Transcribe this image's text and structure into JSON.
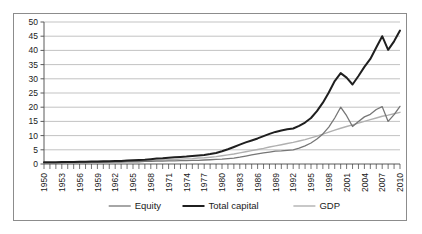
{
  "chart_data": {
    "type": "line",
    "title": "",
    "subtitle": "",
    "xlabel": "",
    "ylabel": "",
    "grid": "horizontal",
    "legend_position": "bottom",
    "ylim": [
      0,
      50
    ],
    "ytick_labels": [
      "0",
      "5",
      "10",
      "15",
      "20",
      "25",
      "30",
      "35",
      "40",
      "45",
      "50"
    ],
    "ytick_values": [
      0,
      5,
      10,
      15,
      20,
      25,
      30,
      35,
      40,
      45,
      50
    ],
    "xlim": [
      1950,
      2010
    ],
    "xtick_labels": [
      "1950",
      "1953",
      "1956",
      "1959",
      "1962",
      "1965",
      "1968",
      "1971",
      "1974",
      "1977",
      "1980",
      "1983",
      "1986",
      "1989",
      "1992",
      "1995",
      "1998",
      "2001",
      "2004",
      "2007",
      "2010"
    ],
    "xtick_values": [
      1950,
      1953,
      1956,
      1959,
      1962,
      1965,
      1968,
      1971,
      1974,
      1977,
      1980,
      1983,
      1986,
      1989,
      1992,
      1995,
      1998,
      2001,
      2004,
      2007,
      2010
    ],
    "x": [
      1950,
      1951,
      1952,
      1953,
      1954,
      1955,
      1956,
      1957,
      1958,
      1959,
      1960,
      1961,
      1962,
      1963,
      1964,
      1965,
      1966,
      1967,
      1968,
      1969,
      1970,
      1971,
      1972,
      1973,
      1974,
      1975,
      1976,
      1977,
      1978,
      1979,
      1980,
      1981,
      1982,
      1983,
      1984,
      1985,
      1986,
      1987,
      1988,
      1989,
      1990,
      1991,
      1992,
      1993,
      1994,
      1995,
      1996,
      1997,
      1998,
      1999,
      2000,
      2001,
      2002,
      2003,
      2004,
      2005,
      2006,
      2007,
      2008,
      2009,
      2010
    ],
    "series": [
      {
        "name": "Equity",
        "color": "#767676",
        "width": 1.3,
        "values": [
          0.4,
          0.4,
          0.4,
          0.4,
          0.5,
          0.5,
          0.5,
          0.5,
          0.6,
          0.6,
          0.6,
          0.7,
          0.7,
          0.7,
          0.8,
          0.8,
          0.8,
          0.9,
          0.9,
          1.0,
          1.0,
          1.1,
          1.1,
          1.2,
          1.2,
          1.3,
          1.3,
          1.4,
          1.5,
          1.6,
          1.7,
          1.9,
          2.1,
          2.4,
          2.8,
          3.2,
          3.6,
          3.9,
          4.2,
          4.5,
          4.6,
          4.8,
          5.0,
          5.6,
          6.4,
          7.4,
          8.8,
          10.6,
          13.0,
          16.2,
          20.0,
          17.0,
          13.2,
          15.0,
          16.6,
          17.5,
          19.2,
          20.2,
          15.0,
          17.4,
          20.3
        ]
      },
      {
        "name": "Total capital",
        "color": "#1f1f1f",
        "width": 2.0,
        "values": [
          0.6,
          0.6,
          0.6,
          0.7,
          0.7,
          0.7,
          0.8,
          0.8,
          0.9,
          0.9,
          1.0,
          1.0,
          1.1,
          1.1,
          1.2,
          1.3,
          1.4,
          1.5,
          1.7,
          1.9,
          2.0,
          2.2,
          2.4,
          2.5,
          2.6,
          2.8,
          3.0,
          3.2,
          3.5,
          3.9,
          4.5,
          5.2,
          6.0,
          6.8,
          7.6,
          8.3,
          9.0,
          9.8,
          10.6,
          11.3,
          11.8,
          12.2,
          12.5,
          13.4,
          14.6,
          16.2,
          18.6,
          21.6,
          25.2,
          29.2,
          32.0,
          30.4,
          28.0,
          31.0,
          34.2,
          37.0,
          41.0,
          45.0,
          40.2,
          43.2,
          47.0
        ]
      },
      {
        "name": "GDP",
        "color": "#b0b0b0",
        "width": 1.4,
        "values": [
          0.5,
          0.5,
          0.5,
          0.6,
          0.6,
          0.6,
          0.7,
          0.7,
          0.7,
          0.8,
          0.8,
          0.8,
          0.9,
          0.9,
          1.0,
          1.0,
          1.1,
          1.1,
          1.2,
          1.3,
          1.4,
          1.5,
          1.6,
          1.7,
          1.8,
          1.9,
          2.1,
          2.2,
          2.4,
          2.6,
          2.9,
          3.2,
          3.5,
          3.9,
          4.3,
          4.7,
          5.1,
          5.5,
          6.0,
          6.4,
          6.8,
          7.2,
          7.6,
          8.1,
          8.6,
          9.2,
          9.8,
          10.5,
          11.2,
          11.9,
          12.6,
          13.2,
          13.8,
          14.4,
          15.0,
          15.6,
          16.2,
          16.8,
          17.2,
          17.7,
          18.2
        ]
      }
    ],
    "legend": [
      {
        "label": "Equity",
        "color": "#767676",
        "width": 1.3
      },
      {
        "label": "Total capital",
        "color": "#1f1f1f",
        "width": 2.0
      },
      {
        "label": "GDP",
        "color": "#b0b0b0",
        "width": 1.4
      }
    ]
  }
}
